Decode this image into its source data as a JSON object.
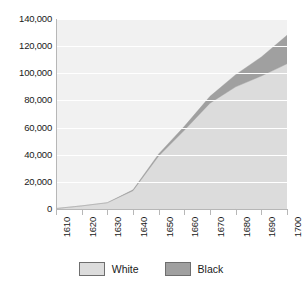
{
  "chart_data": {
    "type": "area",
    "stacked": true,
    "title": "",
    "subtitle": "",
    "xlabel": "",
    "ylabel": "",
    "categories": [
      1610,
      1620,
      1630,
      1640,
      1650,
      1660,
      1670,
      1680,
      1690,
      1700
    ],
    "x": [
      1610,
      1620,
      1630,
      1640,
      1650,
      1660,
      1670,
      1680,
      1690,
      1700
    ],
    "series": [
      {
        "name": "White",
        "color": "#dcdcdc",
        "values": [
          350,
          2300,
          4600,
          13500,
          39000,
          58000,
          78000,
          90000,
          98000,
          107000
        ]
      },
      {
        "name": "Black",
        "color": "#a0a0a0",
        "values": [
          0,
          0,
          60,
          600,
          1600,
          2900,
          5000,
          9000,
          14000,
          21000
        ]
      }
    ],
    "totals": [
      350,
      2300,
      4660,
      14100,
      40600,
      60900,
      83000,
      99000,
      112000,
      128000
    ],
    "y_ticks": [
      0,
      20000,
      40000,
      60000,
      80000,
      100000,
      120000,
      140000
    ],
    "y_tick_labels": [
      "0",
      "20,000",
      "40,000",
      "60,000",
      "80,000",
      "100,000",
      "120,000",
      "140,000"
    ],
    "x_tick_labels": [
      "1610",
      "1620",
      "1630",
      "1640",
      "1650",
      "1660",
      "1670",
      "1680",
      "1690",
      "1700"
    ],
    "ylim": [
      0,
      140000
    ],
    "xlim": [
      1610,
      1700
    ],
    "grid": true,
    "grid_color": "#ffffff",
    "plot_background": "#f1f1f1",
    "legend_position": "bottom"
  },
  "legend": {
    "entries": [
      {
        "label": "White",
        "color": "#dcdcdc"
      },
      {
        "label": "Black",
        "color": "#a0a0a0"
      }
    ]
  }
}
